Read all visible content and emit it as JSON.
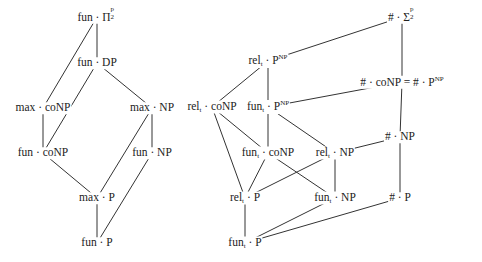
{
  "nodes": {
    "fun_pi2p": {
      "label": "fun · Π",
      "sup": "p",
      "sub": "2",
      "x": 97,
      "y": 17
    },
    "fun_dp": {
      "label": "fun · DP",
      "x": 97,
      "y": 63
    },
    "max_conp": {
      "label": "max · coNP",
      "x": 43,
      "y": 108
    },
    "max_np": {
      "label": "max · NP",
      "x": 152,
      "y": 108
    },
    "fun_conp": {
      "label": "fun · coNP",
      "x": 43,
      "y": 153
    },
    "fun_np": {
      "label": "fun · NP",
      "x": 152,
      "y": 153
    },
    "max_p": {
      "label": "max · P",
      "x": 97,
      "y": 198
    },
    "fun_p": {
      "label": "fun · P",
      "x": 97,
      "y": 243
    },
    "sharp_sigma2p": {
      "label": "# · Σ",
      "sup": "p",
      "sub": "2",
      "x": 402,
      "y": 17
    },
    "relt_pnp": {
      "label_a": "rel",
      "label_sub": "t",
      "label_b": " · P",
      "label_sup": "NP",
      "x": 268,
      "y": 61
    },
    "sharp_conp_eq": {
      "label": "# · coNP = # · P",
      "label_sup": "NP",
      "x": 402,
      "y": 82
    },
    "relt_conp": {
      "label_a": "rel",
      "label_sub": "t",
      "label_b": " · coNP",
      "x": 212,
      "y": 107
    },
    "funt_pnp": {
      "label_a": "fun",
      "label_sub": "t",
      "label_b": " · P",
      "label_sup": "NP",
      "x": 268,
      "y": 107
    },
    "sharp_np": {
      "label": "# · NP",
      "x": 400,
      "y": 137
    },
    "funt_conp": {
      "label_a": "fun",
      "label_sub": "t",
      "label_b": " · coNP",
      "x": 268,
      "y": 153
    },
    "relt_np": {
      "label_a": "rel",
      "label_sub": "t",
      "label_b": " · NP",
      "x": 335,
      "y": 153
    },
    "relt_p": {
      "label_a": "rel",
      "label_sub": "t",
      "label_b": " · P",
      "x": 245,
      "y": 198
    },
    "funt_np": {
      "label_a": "fun",
      "label_sub": "t",
      "label_b": " · NP",
      "x": 335,
      "y": 198
    },
    "sharp_p": {
      "label": "# · P",
      "x": 400,
      "y": 198
    },
    "funt_p": {
      "label_a": "fun",
      "label_sub": "t",
      "label_b": " · P",
      "x": 245,
      "y": 243
    }
  },
  "edges": [
    [
      "fun_pi2p",
      "fun_dp"
    ],
    [
      "fun_pi2p",
      "max_conp"
    ],
    [
      "fun_dp",
      "fun_conp"
    ],
    [
      "fun_dp",
      "max_np"
    ],
    [
      "max_conp",
      "fun_conp"
    ],
    [
      "max_np",
      "fun_np"
    ],
    [
      "max_np",
      "max_p"
    ],
    [
      "fun_conp",
      "max_p"
    ],
    [
      "fun_np",
      "fun_p"
    ],
    [
      "max_p",
      "fun_p"
    ],
    [
      "sharp_sigma2p",
      "relt_pnp"
    ],
    [
      "sharp_sigma2p",
      "sharp_conp_eq"
    ],
    [
      "relt_pnp",
      "relt_conp"
    ],
    [
      "relt_pnp",
      "funt_pnp"
    ],
    [
      "sharp_conp_eq",
      "funt_pnp"
    ],
    [
      "sharp_conp_eq",
      "sharp_np"
    ],
    [
      "relt_conp",
      "funt_conp"
    ],
    [
      "relt_conp",
      "relt_p"
    ],
    [
      "funt_pnp",
      "funt_conp"
    ],
    [
      "funt_pnp",
      "relt_np"
    ],
    [
      "sharp_np",
      "relt_np"
    ],
    [
      "sharp_np",
      "sharp_p"
    ],
    [
      "funt_conp",
      "relt_p"
    ],
    [
      "funt_conp",
      "funt_np"
    ],
    [
      "relt_np",
      "relt_p"
    ],
    [
      "relt_np",
      "funt_np"
    ],
    [
      "relt_p",
      "funt_p"
    ],
    [
      "funt_np",
      "funt_p"
    ],
    [
      "sharp_p",
      "funt_p"
    ]
  ]
}
